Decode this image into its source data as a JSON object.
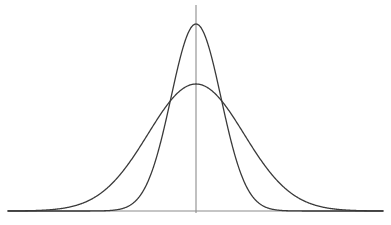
{
  "chart_data": {
    "type": "line",
    "title": "",
    "subtitle": "",
    "xlabel": "",
    "ylabel": "",
    "grid": false,
    "legend": "none",
    "annotations": [],
    "axes": {
      "baseline_y_px": 211,
      "center_x_px": 196,
      "x_axis_left_px": 8,
      "x_axis_right_px": 383,
      "y_axis_top_px": 5,
      "y_axis_bottom_px": 213,
      "xlim": [
        -7.5,
        7.5
      ],
      "ylim": [
        0,
        1.05
      ],
      "xticks": [],
      "yticks": [],
      "axis_color": "#8c8c8c",
      "axis_width_px": 1.1
    },
    "series": [
      {
        "name": "narrow-tall-curve",
        "label": "",
        "mean": 0,
        "sigma": 1.0,
        "peak_height_px": 187,
        "peak_y_px": 24,
        "sigma_px": 25,
        "color": "#3a3a3a",
        "line_width_px": 1.3,
        "x": [
          -7.5,
          -6.5,
          -5.5,
          -4.5,
          -3.5,
          -3.0,
          -2.5,
          -2.0,
          -1.5,
          -1.0,
          -0.5,
          0.0,
          0.5,
          1.0,
          1.5,
          2.0,
          2.5,
          3.0,
          3.5,
          4.5,
          5.5,
          6.5,
          7.5
        ],
        "values": [
          0.0,
          0.0,
          0.0,
          0.0,
          0.004,
          0.011,
          0.044,
          0.135,
          0.325,
          0.607,
          0.882,
          1.0,
          0.882,
          0.607,
          0.325,
          0.135,
          0.044,
          0.011,
          0.004,
          0.0,
          0.0,
          0.0,
          0.0
        ]
      },
      {
        "name": "wide-flat-curve",
        "label": "",
        "mean": 0,
        "sigma": 1.92,
        "peak_height_px": 127,
        "peak_y_px": 84,
        "sigma_px": 48,
        "color": "#3a3a3a",
        "line_width_px": 1.3,
        "x": [
          -7.5,
          -6.5,
          -5.5,
          -4.5,
          -3.5,
          -3.0,
          -2.5,
          -2.0,
          -1.5,
          -1.0,
          -0.5,
          0.0,
          0.5,
          1.0,
          1.5,
          2.0,
          2.5,
          3.0,
          3.5,
          4.5,
          5.5,
          6.5,
          7.5
        ],
        "values": [
          0.022,
          0.053,
          0.113,
          0.215,
          0.364,
          0.456,
          0.55,
          0.645,
          0.735,
          0.841,
          0.94,
          1.0,
          0.94,
          0.841,
          0.735,
          0.645,
          0.55,
          0.456,
          0.364,
          0.215,
          0.113,
          0.053,
          0.022
        ]
      }
    ],
    "intersections": [
      {
        "name": "left-crossing",
        "x_px": 157,
        "y_px": 107
      },
      {
        "name": "right-crossing",
        "x_px": 236,
        "y_px": 107
      }
    ]
  },
  "figure": {
    "background_color": "#ffffff",
    "width_px": 391,
    "height_px": 225
  }
}
